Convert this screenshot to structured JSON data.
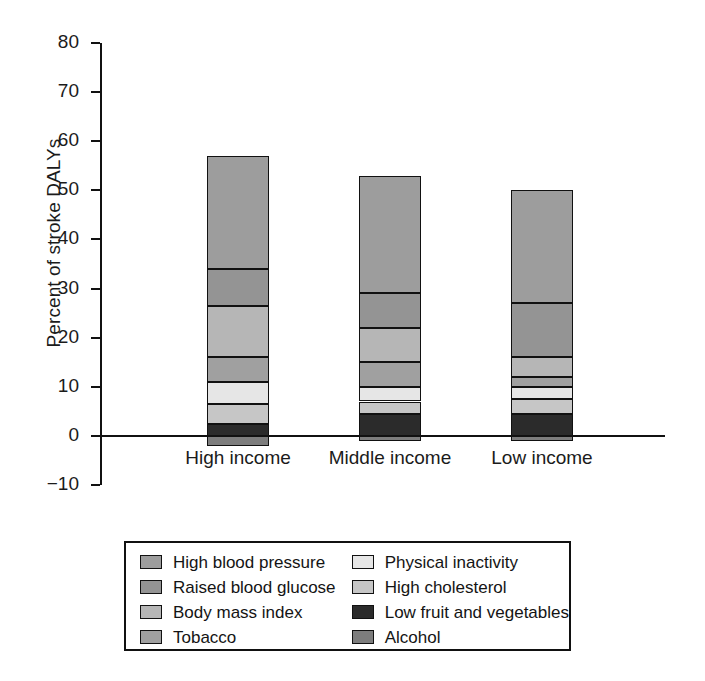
{
  "axes": {
    "ylabel": "Percent of stroke DALYs",
    "yticks": [
      "80",
      "70",
      "60",
      "50",
      "40",
      "30",
      "20",
      "10",
      "0",
      "-10"
    ],
    "ymin": -10,
    "ymax": 80,
    "categories": [
      "High income",
      "Middle income",
      "Low income"
    ]
  },
  "legend": {
    "left": [
      {
        "label": "High blood pressure",
        "color": "#9d9d9d"
      },
      {
        "label": "Raised blood glucose",
        "color": "#949494"
      },
      {
        "label": "Body mass index",
        "color": "#b6b6b6"
      },
      {
        "label": "Tobacco",
        "color": "#a0a0a0"
      }
    ],
    "right": [
      {
        "label": "Physical inactivity",
        "color": "#e6e6e6"
      },
      {
        "label": "High cholesterol",
        "color": "#c6c6c6"
      },
      {
        "label": "Low fruit and vegetables",
        "color": "#2b2b2b"
      },
      {
        "label": "Alcohol",
        "color": "#7d7d7d"
      }
    ]
  },
  "caption": "",
  "chart_data": {
    "type": "bar",
    "subtype": "stacked-bar",
    "title": "",
    "xlabel": "",
    "ylabel": "Percent of stroke DALYs",
    "ylim": [
      -10,
      80
    ],
    "ytick_step": 10,
    "grid": false,
    "legend_position": "bottom",
    "legend_columns": 2,
    "categories": [
      "High income",
      "Middle income",
      "Low income"
    ],
    "stack_order_bottom_to_top": [
      "Alcohol",
      "Low fruit and vegetables",
      "High cholesterol",
      "Physical inactivity",
      "Tobacco",
      "Body mass index",
      "Raised blood glucose",
      "High blood pressure"
    ],
    "series": [
      {
        "name": "Alcohol",
        "color": "#7d7d7d",
        "values": [
          -2.0,
          -1.0,
          -1.0
        ]
      },
      {
        "name": "Low fruit and vegetables",
        "color": "#2b2b2b",
        "values": [
          2.5,
          4.5,
          4.5
        ]
      },
      {
        "name": "High cholesterol",
        "color": "#c6c6c6",
        "values": [
          4.0,
          2.5,
          3.0
        ]
      },
      {
        "name": "Physical inactivity",
        "color": "#e6e6e6",
        "values": [
          4.5,
          3.0,
          2.5
        ]
      },
      {
        "name": "Tobacco",
        "color": "#a0a0a0",
        "values": [
          5.0,
          5.0,
          2.0
        ]
      },
      {
        "name": "Body mass index",
        "color": "#b6b6b6",
        "values": [
          10.5,
          7.0,
          4.0
        ]
      },
      {
        "name": "Raised blood glucose",
        "color": "#949494",
        "values": [
          7.5,
          7.0,
          11.0
        ]
      },
      {
        "name": "High blood pressure",
        "color": "#9d9d9d",
        "values": [
          23.0,
          24.0,
          23.0
        ]
      }
    ],
    "positive_totals": [
      67.0,
      60.5,
      57.0
    ],
    "negative_totals": [
      -2.0,
      -1.0,
      -1.0
    ]
  }
}
